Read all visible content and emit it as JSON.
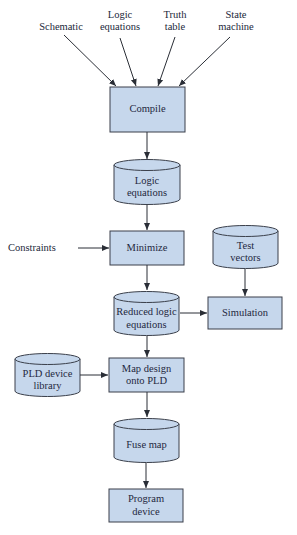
{
  "diagram": {
    "colors": {
      "fill": "#c6d7ec",
      "stroke": "#3a3f4a",
      "text": "#1f2840",
      "arrow": "#2a2e36"
    },
    "inputs": [
      {
        "id": "schematic",
        "line1": "Schematic",
        "line2": ""
      },
      {
        "id": "logic-equations-input",
        "line1": "Logic",
        "line2": "equations"
      },
      {
        "id": "truth-table",
        "line1": "Truth",
        "line2": "table"
      },
      {
        "id": "state-machine",
        "line1": "State",
        "line2": "machine"
      }
    ],
    "nodes": {
      "compile": {
        "shape": "process",
        "line1": "Compile",
        "line2": ""
      },
      "logic_equations": {
        "shape": "data-store",
        "line1": "Logic",
        "line2": "equations"
      },
      "constraints": {
        "shape": "label",
        "line1": "Constraints"
      },
      "minimize": {
        "shape": "process",
        "line1": "Minimize",
        "line2": ""
      },
      "test_vectors": {
        "shape": "data-store",
        "line1": "Test",
        "line2": "vectors"
      },
      "reduced_logic": {
        "shape": "data-store",
        "line1": "Reduced logic",
        "line2": "equations"
      },
      "simulation": {
        "shape": "process",
        "line1": "Simulation",
        "line2": ""
      },
      "pld_library": {
        "shape": "data-store",
        "line1": "PLD device",
        "line2": "library"
      },
      "map_design": {
        "shape": "process",
        "line1": "Map design",
        "line2": "onto PLD"
      },
      "fuse_map": {
        "shape": "data-store",
        "line1": "Fuse map",
        "line2": ""
      },
      "program_device": {
        "shape": "process",
        "line1": "Program",
        "line2": "device"
      }
    },
    "edges": [
      [
        "Schematic",
        "Compile"
      ],
      [
        "Logic equations",
        "Compile"
      ],
      [
        "Truth table",
        "Compile"
      ],
      [
        "State machine",
        "Compile"
      ],
      [
        "Compile",
        "Logic equations"
      ],
      [
        "Logic equations",
        "Minimize"
      ],
      [
        "Constraints",
        "Minimize"
      ],
      [
        "Minimize",
        "Reduced logic equations"
      ],
      [
        "Test vectors",
        "Simulation"
      ],
      [
        "Reduced logic equations",
        "Simulation"
      ],
      [
        "Reduced logic equations",
        "Map design onto PLD"
      ],
      [
        "PLD device library",
        "Map design onto PLD"
      ],
      [
        "Map design onto PLD",
        "Fuse map"
      ],
      [
        "Fuse map",
        "Program device"
      ]
    ]
  }
}
